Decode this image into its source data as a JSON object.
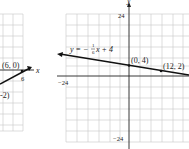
{
  "left_graph": {
    "point_label": "(6, 0)",
    "partial_point_label": "-2)",
    "x_tick_label": "6",
    "axis_label_x": "x"
  },
  "right_graph": {
    "equation_label": "y = -1/6x + 4",
    "equation_prefix": "y = −",
    "equation_frac_num": "1",
    "equation_frac_den": "6",
    "equation_suffix": "x + 4",
    "points": [
      {
        "label": "(0, 4)"
      },
      {
        "label": "(12, 2)"
      }
    ],
    "y_axis_label": "y",
    "y_tick_top": "24",
    "y_tick_bottom": "−24",
    "x_tick_left": "−24"
  },
  "colors": {
    "grid": "#c8c8c8",
    "axis": "#222222",
    "line": "#111111",
    "background": "#ffffff"
  }
}
